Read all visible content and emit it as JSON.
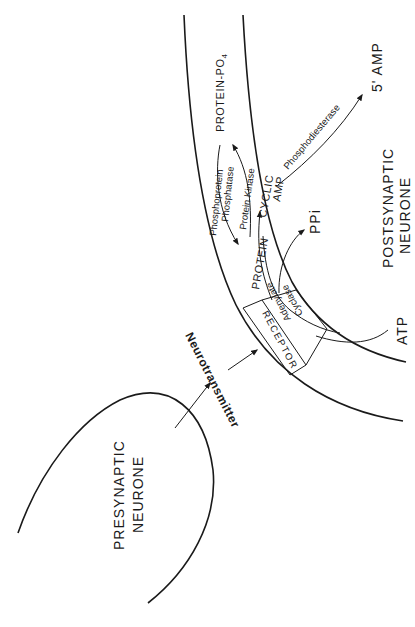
{
  "diagram": {
    "labels": {
      "presynaptic_line1": "PRESYNAPTIC",
      "presynaptic_line2": "NEURONE",
      "postsynaptic_line1": "POSTSYNAPTIC",
      "postsynaptic_line2": "NEURONE",
      "neurotransmitter": "Neurotransmitter",
      "receptor": "RECEPTOR",
      "adenylate": "Adenylate",
      "cyclase": "Cyclase",
      "atp": "ATP",
      "ppi": "PPi",
      "cyclic": "CYCLIC",
      "amp": "AMP",
      "protein": "PROTEIN",
      "protein_po4": "PROTEIN-PO",
      "po4_subscript": "4",
      "protein_kinase": "Protein Kinase",
      "phosphoprotein": "Phosphoprotein",
      "phosphatase": "Phosphatase",
      "phosphodiesterase": "Phosphodiesterase",
      "five_amp": "5' AMP"
    },
    "colors": {
      "ink": "#1a1a1a",
      "background": "#ffffff"
    }
  }
}
